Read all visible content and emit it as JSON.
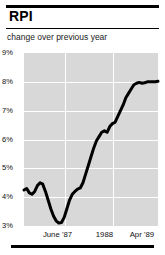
{
  "header": {
    "title": "RPI",
    "subtitle": "change over previous year"
  },
  "chart_data": {
    "type": "line",
    "title": "RPI",
    "subtitle": "change over previous year",
    "xlabel": "",
    "ylabel": "",
    "ylim": [
      3,
      9
    ],
    "yticks": [
      9,
      8,
      7,
      6,
      5,
      4,
      3
    ],
    "ytick_labels": [
      "9%",
      "8%",
      "7%",
      "6%",
      "5%",
      "4%",
      "3%"
    ],
    "xtick_labels": [
      "June '87",
      "1988",
      "Apr '89"
    ],
    "xtick_positions": [
      0.25,
      0.6,
      0.88
    ],
    "grid": true,
    "grid_color": "#ffffff",
    "plot_background": "#d8d8d8",
    "line_color": "#000000",
    "line_width": 3,
    "x": [
      0,
      2,
      4,
      6,
      8,
      10,
      12,
      14,
      16,
      18,
      20,
      22,
      24,
      26,
      28,
      30,
      32,
      34,
      36,
      38,
      40,
      42,
      44,
      46,
      48,
      50,
      52,
      54,
      56,
      58,
      60,
      62,
      64,
      66,
      68,
      70,
      72,
      74,
      76,
      78,
      80,
      82,
      84,
      86,
      88,
      90,
      92,
      94,
      96,
      98,
      100
    ],
    "values": [
      4.25,
      4.3,
      4.15,
      4.1,
      4.2,
      4.4,
      4.5,
      4.45,
      4.2,
      3.9,
      3.6,
      3.35,
      3.18,
      3.1,
      3.12,
      3.3,
      3.6,
      3.9,
      4.1,
      4.2,
      4.28,
      4.32,
      4.5,
      4.8,
      5.1,
      5.4,
      5.7,
      5.95,
      6.1,
      6.25,
      6.3,
      6.25,
      6.45,
      6.55,
      6.6,
      6.8,
      7.0,
      7.2,
      7.45,
      7.6,
      7.75,
      7.9,
      7.95,
      7.98,
      7.95,
      7.97,
      8.0,
      8.0,
      8.0,
      8.0,
      8.02
    ]
  }
}
